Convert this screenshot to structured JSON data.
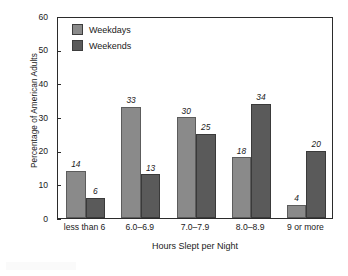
{
  "chart_data": {
    "type": "bar",
    "title": "",
    "subtitle": "",
    "xlabel": "Hours Slept per Night",
    "ylabel": "Percentage of American Adults",
    "categories": [
      "less than 6",
      "6.0–6.9",
      "7.0–7.9",
      "8.0–8.9",
      "9 or more"
    ],
    "series": [
      {
        "name": "Weekdays",
        "values": [
          14,
          33,
          30,
          18,
          4
        ],
        "color": "#8a8a8a"
      },
      {
        "name": "Weekends",
        "values": [
          6,
          13,
          25,
          34,
          20
        ],
        "color": "#5a5a5a"
      }
    ],
    "ylim": [
      0,
      60
    ],
    "yticks": [
      0,
      10,
      20,
      30,
      40,
      50,
      60
    ],
    "ytick_labels": [
      "0",
      "10",
      "20",
      "30",
      "40",
      "50",
      "60"
    ],
    "grid": false,
    "legend_position": "top-left",
    "data_labels": true,
    "data_label_style": "italic",
    "bar_group_gap": true,
    "frame": "box"
  },
  "legend": {
    "items": [
      {
        "label": "Weekdays",
        "color": "#8a8a8a"
      },
      {
        "label": "Weekends",
        "color": "#5a5a5a"
      }
    ]
  },
  "axes": {
    "x_title": "Hours Slept per Night",
    "y_title": "Percentage of American Adults"
  }
}
